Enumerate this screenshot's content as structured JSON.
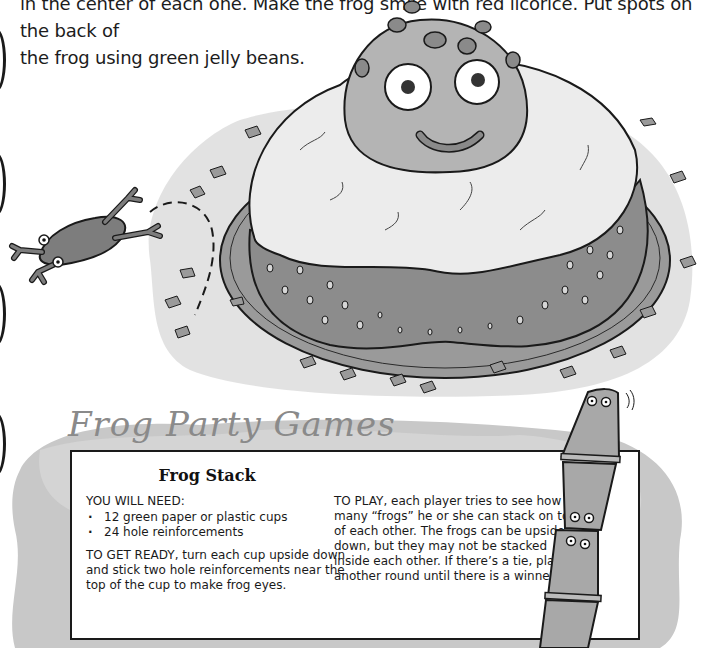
{
  "intro": {
    "line1": "in the center of each one. Make the frog smile with red licorice. Put spots on the back of",
    "line2": "the frog using green jelly beans."
  },
  "illustrations": {
    "cake": "frog-cake-illustration",
    "jumping_frog": "jumping-frog-illustration",
    "cup_stack": "frog-cup-stack-illustration"
  },
  "games": {
    "section_title": "Frog Party Games",
    "game": {
      "title": "Frog Stack",
      "need_label": "YOU WILL NEED:",
      "items": [
        "12 green paper or plastic cups",
        "24 hole reinforcements"
      ],
      "get_ready": "TO GET READY, turn each cup upside down and stick two hole reinforcements near the top of the cup to make frog eyes.",
      "to_play": "TO PLAY, each player tries to see how many “frogs” he or she can stack on top of each other. The frogs can be upside down, but they may not be stacked inside each other. If there’s a tie, play another round until there is a winner."
    }
  },
  "colors": {
    "frog_gray": "#8c8c8c",
    "frosting": "#e8e8e8",
    "plate": "#9a9a9a",
    "smudge": "#cfcfcf",
    "border": "#1a1a1a"
  }
}
